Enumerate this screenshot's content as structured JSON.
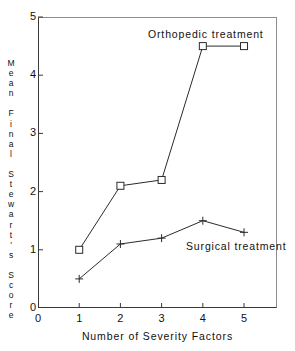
{
  "chart_data": {
    "type": "line",
    "title": "",
    "xlabel": "Number of Severity Factors",
    "ylabel": "Mean Final Stewart's Score",
    "ylabel_stacked": "M\ne\na\nn\n\nF\ni\nn\na\nl\n\nS\nt\ne\nw\na\nr\nt\n'\ns\n\nS\nc\no\nr\ne",
    "x": [
      1,
      2,
      3,
      4,
      5
    ],
    "xlim": [
      0,
      5.8
    ],
    "ylim": [
      0,
      5
    ],
    "xticks": [
      0,
      1,
      2,
      3,
      4,
      5
    ],
    "yticks": [
      0,
      1,
      2,
      3,
      4,
      5
    ],
    "xtick_labels": [
      "0",
      "1",
      "2",
      "3",
      "4",
      "5"
    ],
    "ytick_labels": [
      "0",
      "1",
      "2",
      "3",
      "4",
      "5"
    ],
    "grid": false,
    "legend_position": "inline-annotation",
    "series": [
      {
        "name": "Orthopedic treatment",
        "marker": "square",
        "color": "#2b2b2b",
        "values": [
          1.0,
          2.1,
          2.2,
          4.5,
          4.5
        ]
      },
      {
        "name": "Surgical treatment",
        "marker": "plus",
        "color": "#2b2b2b",
        "values": [
          0.5,
          1.1,
          1.2,
          1.5,
          1.3
        ]
      }
    ],
    "annotations": [
      {
        "text": "Orthopedic treatment",
        "x": 3.55,
        "y": 4.86
      },
      {
        "text": "Surgical treatment",
        "x": 4.1,
        "y": 1.18
      }
    ]
  },
  "colors": {
    "background": "#ffffff",
    "axis": "#3a3a3a",
    "frame_light": "#8d8d8d",
    "ink": "#111111"
  }
}
